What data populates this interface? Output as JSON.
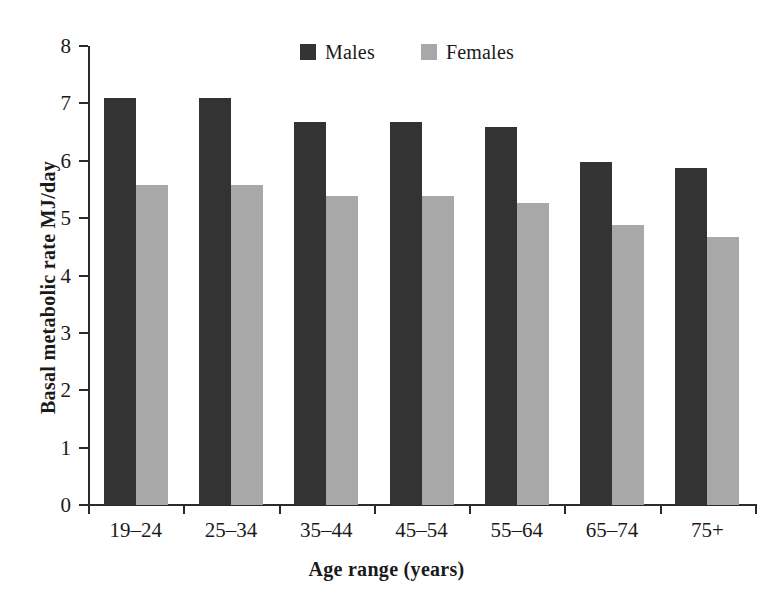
{
  "chart_data": {
    "type": "bar",
    "title": "",
    "xlabel": "Age range (years)",
    "ylabel": "Basal metabolic rate MJ/day",
    "categories": [
      "19–24",
      "25–34",
      "35–44",
      "45–54",
      "55–64",
      "65–74",
      "75+"
    ],
    "series": [
      {
        "name": "Males",
        "color": "#333333",
        "values": [
          7.1,
          7.1,
          6.68,
          6.68,
          6.58,
          5.97,
          5.87
        ]
      },
      {
        "name": "Females",
        "color": "#a8a8a8",
        "values": [
          5.58,
          5.58,
          5.38,
          5.38,
          5.27,
          4.88,
          4.68
        ]
      }
    ],
    "ylim": [
      0,
      8
    ],
    "yticks": [
      "0",
      "1",
      "2",
      "3",
      "4",
      "5",
      "6",
      "7",
      "8"
    ],
    "grid": false,
    "legend_position": "top-center"
  },
  "legend": {
    "entries": [
      {
        "label": "Males",
        "swatch_color": "#333333"
      },
      {
        "label": "Females",
        "swatch_color": "#a8a8a8"
      }
    ]
  },
  "colors": {
    "males": "#333333",
    "females": "#a8a8a8",
    "axis": "#2b2b2b",
    "text": "#1a1a1a",
    "background": "#ffffff"
  }
}
